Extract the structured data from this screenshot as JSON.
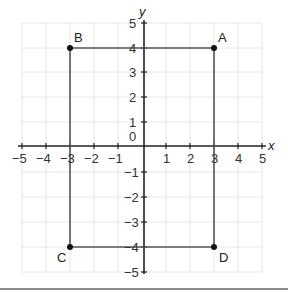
{
  "diagram": {
    "type": "coordinate-plane",
    "axes": {
      "x_label": "x",
      "y_label": "y",
      "x_range": [
        -5,
        5
      ],
      "y_range": [
        -5,
        5
      ],
      "x_ticks": [
        "−5",
        "−4",
        "−3",
        "−2",
        "−1",
        "1",
        "2",
        "3",
        "4",
        "5"
      ],
      "y_ticks": [
        "5",
        "4",
        "3",
        "2",
        "1",
        "0",
        "−1",
        "−2",
        "−3",
        "−4",
        "−5"
      ],
      "origin_label": "0",
      "grid": true
    },
    "points": [
      {
        "name": "A",
        "x": 3,
        "y": 4
      },
      {
        "name": "B",
        "x": -3,
        "y": 4
      },
      {
        "name": "C",
        "x": -3,
        "y": -4
      },
      {
        "name": "D",
        "x": 3,
        "y": -4
      }
    ],
    "shape": "rectangle ABCD",
    "colors": {
      "grid": "#e6e6e6",
      "axes": "#222222",
      "shape": "#555555",
      "points": "#111111"
    }
  }
}
